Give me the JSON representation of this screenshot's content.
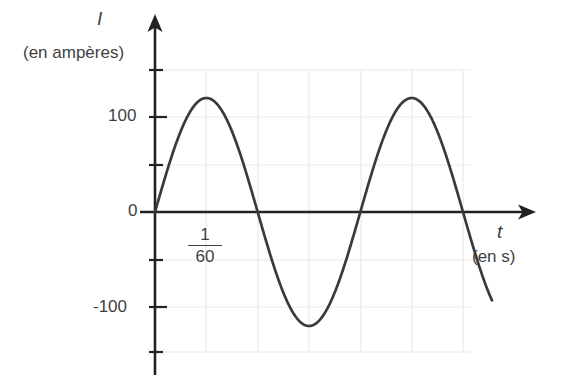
{
  "chart_data": {
    "type": "line",
    "title": "",
    "subtitle": "",
    "curve_description": "sinusoidal alternating current waveform",
    "xlabel": "t",
    "xlabel_units": "(en s)",
    "ylabel": "I",
    "ylabel_units": "(en ampères)",
    "ylim": [
      -150,
      150
    ],
    "xlim": [
      0,
      0.0333
    ],
    "amplitude": 120,
    "period": 0.01667,
    "frequency_hz": 60,
    "grid": true,
    "legend": null,
    "y_tick_labels": [
      "100",
      "0",
      "-100"
    ],
    "y_tick_values": [
      100,
      0,
      -100
    ],
    "x_tick_labels": [
      "1/60"
    ],
    "x_annotation_numerator": "1",
    "x_annotation_denominator": "60",
    "x_zero_crossings": [
      0,
      0.008333,
      0.016667,
      0.025,
      0.033333
    ],
    "peaks": [
      {
        "x": 0.004167,
        "y": 120
      },
      {
        "x": 0.020833,
        "y": 120
      }
    ],
    "troughs": [
      {
        "x": 0.0125,
        "y": -120
      }
    ],
    "series": [
      {
        "name": "I(t)",
        "x": [
          0.0,
          0.000833,
          0.001667,
          0.0025,
          0.003333,
          0.004167,
          0.005,
          0.005833,
          0.006667,
          0.0075,
          0.008333,
          0.009167,
          0.01,
          0.010833,
          0.011667,
          0.0125,
          0.013333,
          0.014167,
          0.015,
          0.015833,
          0.016667,
          0.0175,
          0.018333,
          0.019167,
          0.02,
          0.020833,
          0.021667,
          0.0225,
          0.023333,
          0.024167,
          0.025,
          0.025833,
          0.026667,
          0.0275,
          0.028333,
          0.029167,
          0.03,
          0.030833,
          0.031667,
          0.0325,
          0.033333,
          0.034167,
          0.035
        ],
        "values": [
          0,
          46,
          85,
          111,
          120,
          120,
          111,
          85,
          46,
          0,
          0,
          -46,
          -85,
          -111,
          -120,
          -120,
          -111,
          -85,
          -46,
          0,
          0,
          46,
          85,
          111,
          120,
          120,
          111,
          85,
          46,
          0,
          0,
          -46,
          -85,
          -111,
          -120,
          -120,
          -111,
          -85,
          -46,
          -38,
          -40,
          -42,
          -44
        ]
      }
    ],
    "colors": {
      "curve": "#3a3a3a",
      "axis": "#1a1a1a",
      "grid": "#e8e8e8",
      "background": "#ffffff",
      "text": "#3f3f3f"
    }
  }
}
